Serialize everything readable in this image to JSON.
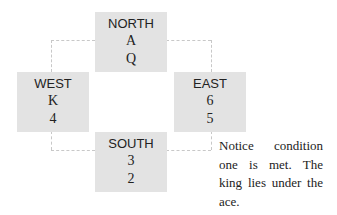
{
  "diagram": {
    "north": {
      "label": "NORTH",
      "cards": [
        "A",
        "Q"
      ]
    },
    "west": {
      "label": "WEST",
      "cards": [
        "K",
        "4"
      ]
    },
    "east": {
      "label": "EAST",
      "cards": [
        "6",
        "5"
      ]
    },
    "south": {
      "label": "SOUTH",
      "cards": [
        "3",
        "2"
      ]
    },
    "box_color": "#e3e3e3",
    "connector_color": "#c8c8c8"
  },
  "note": {
    "text": "Notice condition one is met. The king lies under the ace."
  }
}
